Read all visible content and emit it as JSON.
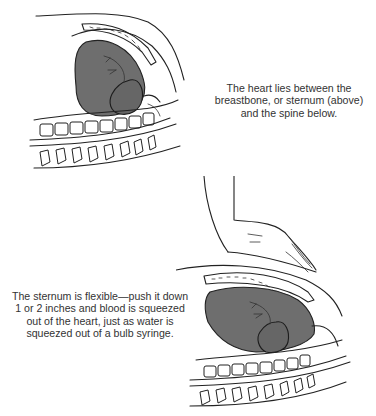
{
  "figure": {
    "top_illustration": {
      "label": "Chest cross-section with heart between sternum and spine",
      "caption_lines": [
        "The heart lies between the",
        "breastbone, or sternum (above)",
        "and the spine below."
      ]
    },
    "bottom_illustration": {
      "label": "Hand compressing the sternum over the heart",
      "caption_lines": [
        "The sternum is flexible—push it down",
        "1 or 2 inches and blood is squeezed",
        "out of the heart, just as water is",
        "squeezed out of a bulb syringe."
      ]
    },
    "colors": {
      "organ_fill": "#6e6e6e",
      "line": "#222222",
      "background": "#ffffff"
    }
  }
}
